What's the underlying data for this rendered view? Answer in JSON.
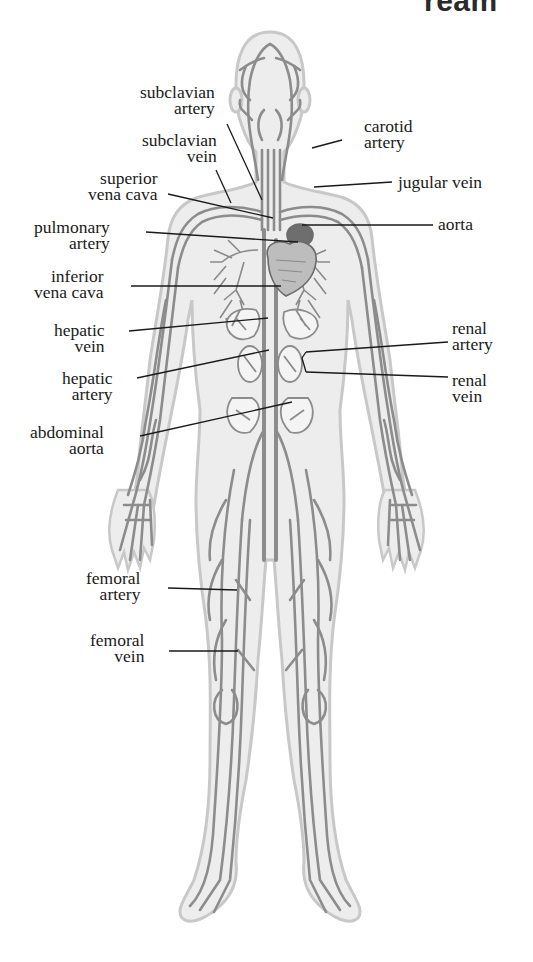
{
  "header": {
    "title_fragment": "ream"
  },
  "diagram": {
    "colors": {
      "body_fill": "#ececec",
      "body_outline": "#c4c4c4",
      "vessel": "#8a8a8a",
      "vessel_dark": "#6e6e6e",
      "heart": "#7a7a7a",
      "leader_line": "#1a1a1a",
      "text": "#1a1a1a"
    },
    "labels": {
      "subclavian_artery": {
        "line1": "subclavian",
        "line2": "artery"
      },
      "subclavian_vein": {
        "line1": "subclavian",
        "line2": "vein"
      },
      "carotid_artery": {
        "line1": "carotid",
        "line2": "artery"
      },
      "superior_vena_cava": {
        "line1": "superior",
        "line2": "vena cava"
      },
      "jugular_vein": {
        "line1": "jugular vein"
      },
      "pulmonary_artery": {
        "line1": "pulmonary",
        "line2": "artery"
      },
      "aorta": {
        "line1": "aorta"
      },
      "inferior_vena_cava": {
        "line1": "inferior",
        "line2": "vena cava"
      },
      "hepatic_vein": {
        "line1": "hepatic",
        "line2": "vein"
      },
      "renal_artery": {
        "line1": "renal",
        "line2": "artery"
      },
      "hepatic_artery": {
        "line1": "hepatic",
        "line2": "artery"
      },
      "renal_vein": {
        "line1": "renal",
        "line2": "vein"
      },
      "abdominal_aorta": {
        "line1": "abdominal",
        "line2": "aorta"
      },
      "femoral_artery": {
        "line1": "femoral",
        "line2": "artery"
      },
      "femoral_vein": {
        "line1": "femoral",
        "line2": "vein"
      }
    }
  }
}
